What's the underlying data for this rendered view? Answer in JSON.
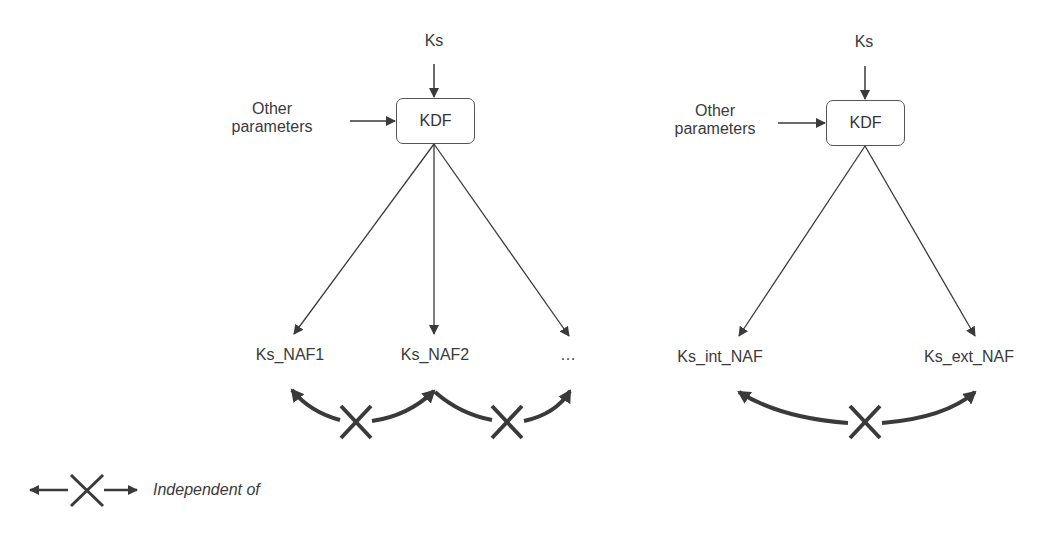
{
  "left_diagram": {
    "input_top": "Ks",
    "input_side": "Other\nparameters",
    "input_side_lines": [
      "Other",
      "parameters"
    ],
    "function_box": "KDF",
    "outputs": [
      "Ks_NAF1",
      "Ks_NAF2",
      "…"
    ],
    "relations": [
      "independent-of (Ks_NAF1, Ks_NAF2)",
      "independent-of (Ks_NAF2, …)"
    ]
  },
  "right_diagram": {
    "input_top": "Ks",
    "input_side_lines": [
      "Other",
      "parameters"
    ],
    "function_box": "KDF",
    "outputs": [
      "Ks_int_NAF",
      "Ks_ext_NAF"
    ],
    "relations": [
      "independent-of (Ks_int_NAF, Ks_ext_NAF)"
    ]
  },
  "legend": {
    "symbol": "arrow-cross-arrow",
    "label": "Independent of"
  },
  "colors": {
    "stroke": "#3a3a3a",
    "text": "#3a3a3a",
    "background": "#ffffff"
  }
}
